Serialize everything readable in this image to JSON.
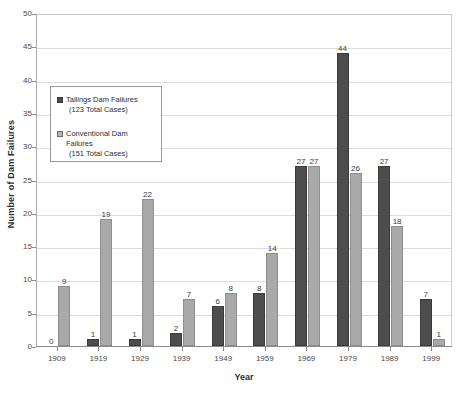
{
  "chart_data": {
    "type": "bar",
    "title": "",
    "xlabel": "Year",
    "ylabel": "Number of Dam Failures",
    "ylim": [
      0,
      50
    ],
    "ytick_step": 5,
    "yticks": [
      0,
      5,
      10,
      15,
      20,
      25,
      30,
      35,
      40,
      45,
      50
    ],
    "grid": true,
    "legend_position": "upper-left-inside",
    "categories": [
      "1909",
      "1919",
      "1929",
      "1939",
      "1949",
      "1959",
      "1969",
      "1979",
      "1989",
      "1999"
    ],
    "series": [
      {
        "name": "Tailings Dam Failures",
        "total_label": "(123 Total Cases)",
        "color": "#4d4d4d",
        "values": [
          0,
          1,
          1,
          2,
          6,
          8,
          27,
          44,
          27,
          7
        ],
        "labels": [
          "0",
          "1",
          "1",
          "2",
          "6",
          "8",
          "27",
          "44",
          "27",
          "7"
        ]
      },
      {
        "name": "Conventional Dam Failures",
        "total_label": "(151 Total Cases)",
        "color": "#a9a9a9",
        "values": [
          9,
          19,
          22,
          7,
          8,
          14,
          27,
          26,
          18,
          1
        ],
        "labels": [
          "9",
          "19",
          "22",
          "7",
          "8",
          "14",
          "27",
          "26",
          "18",
          "1"
        ]
      }
    ]
  },
  "legend": {
    "entries": [
      {
        "label": "Tailings Dam Failures",
        "sub": "(123 Total Cases)",
        "swatch": "tailings"
      },
      {
        "label": "Conventional Dam Failures",
        "sub": "(151 Total Cases)",
        "swatch": "conventional"
      }
    ]
  },
  "axes": {
    "y_title": "Number of Dam Failures",
    "x_title": "Year"
  }
}
